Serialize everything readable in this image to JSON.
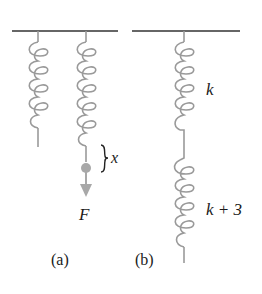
{
  "figure": {
    "panels": [
      {
        "id": "a",
        "caption": "(a)",
        "force_label": "F",
        "displacement_label": "x"
      },
      {
        "id": "b",
        "caption": "(b)",
        "spring_labels": [
          "k",
          "k + 3"
        ]
      }
    ],
    "colors": {
      "ceiling": "#333333",
      "spring": "#9a9a9a",
      "mass": "#a8a8a8",
      "text": "#1a1a1a"
    }
  }
}
